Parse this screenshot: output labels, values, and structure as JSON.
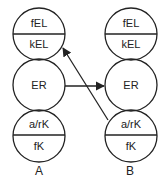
{
  "diagram": {
    "columns": [
      {
        "label": "A",
        "top_upper": "fEL",
        "top_lower": "kEL",
        "middle": "ER",
        "bottom_upper": "a/rK",
        "bottom_lower": "fK"
      },
      {
        "label": "B",
        "top_upper": "fEL",
        "top_lower": "kEL",
        "middle": "ER",
        "bottom_upper": "a/rK",
        "bottom_lower": "fK"
      }
    ],
    "arrows": [
      {
        "from": "A.ER",
        "to": "B.ER"
      },
      {
        "from": "B.a/rK",
        "to": "A.kEL"
      }
    ],
    "colors": {
      "stroke": "#222222",
      "background": "#ffffff"
    }
  }
}
